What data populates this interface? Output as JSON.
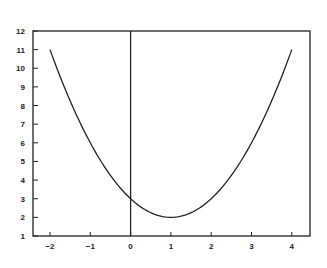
{
  "chart_data": {
    "type": "line",
    "title": "",
    "xlabel": "",
    "ylabel": "",
    "xlim": [
      -2.4,
      4.45
    ],
    "ylim": [
      1,
      12
    ],
    "grid": false,
    "legend": null,
    "x_ticks": [
      -2,
      -1,
      0,
      1,
      2,
      3,
      4
    ],
    "x_tick_labels": [
      "−2",
      "−1",
      "0",
      "1",
      "2",
      "3",
      "4"
    ],
    "y_ticks": [
      1,
      2,
      3,
      4,
      5,
      6,
      7,
      8,
      9,
      10,
      11,
      12
    ],
    "y_tick_labels": [
      "1",
      "2",
      "3",
      "4",
      "5",
      "6",
      "7",
      "8",
      "9",
      "10",
      "11",
      "12"
    ],
    "vertical_line_at_x": 0,
    "series": [
      {
        "name": "y = (x - 1)^2 + 2",
        "x": [
          -2,
          -1.5,
          -1,
          -0.5,
          0,
          0.5,
          1,
          1.5,
          2,
          2.5,
          3,
          3.5,
          4
        ],
        "values": [
          11,
          8.25,
          6,
          4.25,
          3,
          2.25,
          2,
          2.25,
          3,
          4.25,
          6,
          8.25,
          11
        ]
      }
    ],
    "annotations": [
      {
        "text": "minimum",
        "x": 1,
        "y": 2
      }
    ]
  },
  "layout": {
    "frame": {
      "left": 33,
      "top": 31,
      "right": 310,
      "bottom": 236
    },
    "x_px_per_unit": 40.3,
    "x_zero_px": 130.6,
    "y_px_per_unit": 18.64,
    "y_one_px": 236,
    "colors": {
      "axis": "#222222",
      "curve": "#222222",
      "background": "#ffffff"
    }
  }
}
